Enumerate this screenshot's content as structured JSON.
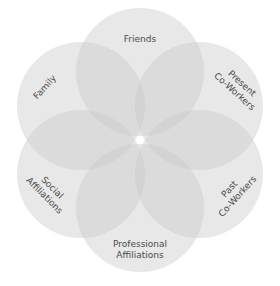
{
  "diagram": {
    "type": "venn-rosette",
    "circle_color": "#c8c8c8",
    "circle_opacity": 0.42,
    "label_color": "#4a4a4a",
    "circles": [
      {
        "id": "friends",
        "lines": [
          "Friends"
        ]
      },
      {
        "id": "present-co-workers",
        "lines": [
          "Present",
          "Co-Workers"
        ]
      },
      {
        "id": "past-co-workers",
        "lines": [
          "Past",
          "Co-Workers"
        ]
      },
      {
        "id": "professional-affiliations",
        "lines": [
          "Professional",
          "Affiliations"
        ]
      },
      {
        "id": "social-affiliations",
        "lines": [
          "Social",
          "Affiliations"
        ]
      },
      {
        "id": "family",
        "lines": [
          "Family"
        ]
      }
    ]
  }
}
